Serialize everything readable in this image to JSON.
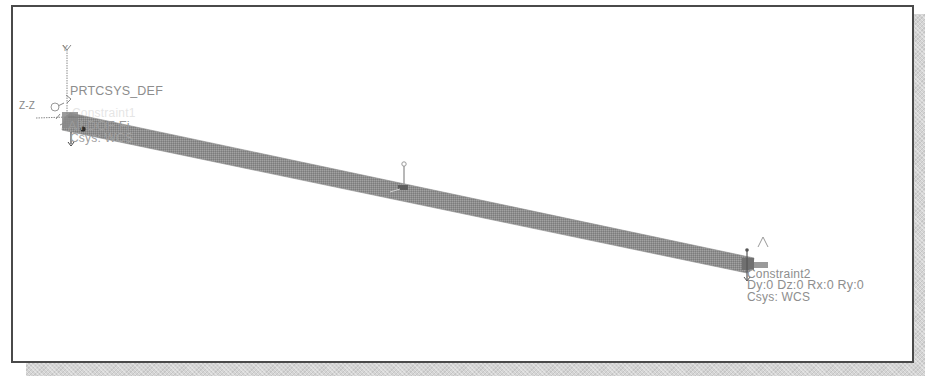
{
  "viewport": {
    "background": "#ffffff",
    "border_color": "#4a4a4a",
    "beam_color": "#8f8f8f"
  },
  "coordinate_system": {
    "name": "PRT_CSYS_DEF",
    "display_name": "PRTCSYS_DEF",
    "axis_y": "Y",
    "axis_z": "Z-Z"
  },
  "constraints": [
    {
      "name": "Constraint1",
      "dof": "All DOF Fi",
      "csys": "Csys: WCS"
    },
    {
      "name": "Constraint2",
      "dof": "Dy:0 Dz:0 Rx:0 Ry:0",
      "csys": "Csys: WCS"
    }
  ],
  "beam": {
    "start": [
      68,
      126
    ],
    "end": [
      752,
      265
    ],
    "thickness": 11
  },
  "load_marker": {
    "position": [
      404,
      186
    ]
  }
}
